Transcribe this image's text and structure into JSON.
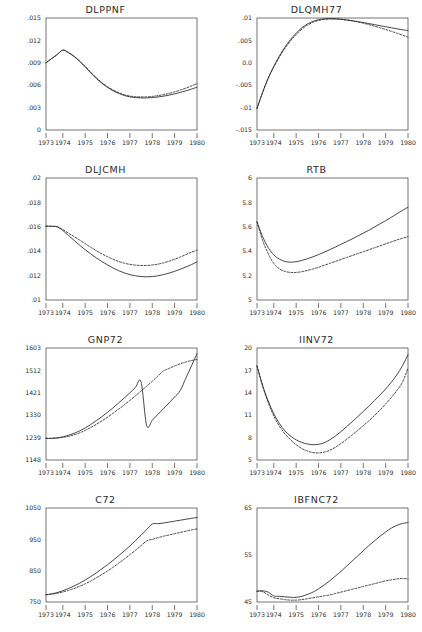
{
  "figure": {
    "layout": "2 columns x 4 rows of line charts",
    "x_categories": [
      "1973",
      "1974",
      "1975",
      "1976",
      "1977",
      "1978",
      "1979",
      "1980"
    ],
    "series_names": [
      "solid",
      "dashed"
    ]
  },
  "chart_data": [
    {
      "type": "line",
      "title": "DLPPNF",
      "xlabel": "",
      "ylabel": "",
      "xlim": [
        1973.25,
        1980.0
      ],
      "ylim": [
        0,
        0.015
      ],
      "grid": false,
      "legend": "none",
      "xticklabels": [
        "1973",
        "1974",
        "1975",
        "1976",
        "1977",
        "1978",
        "1979",
        "1980"
      ],
      "yticklabels": [
        "0",
        ".003",
        ".006",
        ".009",
        ".012",
        ".015"
      ],
      "ytickvalues": [
        0,
        0.003,
        0.006,
        0.009,
        0.012,
        0.015
      ],
      "x": [
        1973.25,
        1973.5,
        1973.75,
        1974.0,
        1974.25,
        1974.5,
        1974.75,
        1975.0,
        1975.25,
        1975.5,
        1975.75,
        1976.0,
        1976.25,
        1976.5,
        1976.75,
        1977.0,
        1977.25,
        1977.5,
        1977.75,
        1978.0,
        1978.25,
        1978.5,
        1978.75,
        1979.0,
        1979.25,
        1979.5,
        1979.75,
        1980.0
      ],
      "series": [
        {
          "name": "solid",
          "values": [
            0.009,
            0.00955,
            0.0101,
            0.0107,
            0.01035,
            0.00985,
            0.0092,
            0.00845,
            0.00765,
            0.0069,
            0.00625,
            0.0057,
            0.00525,
            0.0049,
            0.00462,
            0.00444,
            0.00434,
            0.0043,
            0.0043,
            0.00434,
            0.00442,
            0.00453,
            0.00467,
            0.00484,
            0.00503,
            0.00524,
            0.00548,
            0.00572
          ]
        },
        {
          "name": "dashed",
          "values": [
            0.009,
            0.00955,
            0.0101,
            0.0107,
            0.0104,
            0.0099,
            0.00925,
            0.00852,
            0.00775,
            0.007,
            0.00636,
            0.0058,
            0.00535,
            0.005,
            0.00472,
            0.00454,
            0.00446,
            0.00443,
            0.00444,
            0.0045,
            0.0046,
            0.00473,
            0.0049,
            0.0051,
            0.00534,
            0.0056,
            0.0059,
            0.00622
          ]
        }
      ]
    },
    {
      "type": "line",
      "title": "DLQMH77",
      "xlabel": "",
      "ylabel": "",
      "xlim": [
        1973.25,
        1980.0
      ],
      "ylim": [
        -0.015,
        0.01
      ],
      "grid": false,
      "legend": "none",
      "xticklabels": [
        "1973",
        "1974",
        "1975",
        "1976",
        "1977",
        "1978",
        "1979",
        "1980"
      ],
      "yticklabels": [
        "-.015",
        "-.01",
        "-.005",
        "0.0",
        ".005",
        ".01"
      ],
      "ytickvalues": [
        -0.015,
        -0.01,
        -0.005,
        0.0,
        0.005,
        0.01
      ],
      "x": [
        1973.25,
        1973.5,
        1973.75,
        1974.0,
        1974.25,
        1974.5,
        1974.75,
        1975.0,
        1975.25,
        1975.5,
        1975.75,
        1976.0,
        1976.25,
        1976.5,
        1976.75,
        1977.0,
        1977.25,
        1977.5,
        1977.75,
        1978.0,
        1978.25,
        1978.5,
        1978.75,
        1979.0,
        1979.25,
        1979.5,
        1979.75,
        1980.0
      ],
      "series": [
        {
          "name": "solid",
          "values": [
            -0.0102,
            -0.0066,
            -0.0034,
            -0.0008,
            0.0015,
            0.0035,
            0.0052,
            0.0066,
            0.0078,
            0.00865,
            0.00925,
            0.00962,
            0.0098,
            0.00985,
            0.00982,
            0.00972,
            0.00958,
            0.0094,
            0.0092,
            0.00898,
            0.00876,
            0.00852,
            0.00828,
            0.00805,
            0.00782,
            0.0076,
            0.00738,
            0.00718
          ]
        },
        {
          "name": "dashed",
          "values": [
            -0.0102,
            -0.00665,
            -0.0035,
            -0.00095,
            0.0013,
            0.00325,
            0.00492,
            0.0063,
            0.00748,
            0.00838,
            0.00902,
            0.00945,
            0.00968,
            0.00978,
            0.00978,
            0.0097,
            0.00955,
            0.00936,
            0.00912,
            0.00884,
            0.00852,
            0.00818,
            0.00782,
            0.00744,
            0.00704,
            0.00662,
            0.00618,
            0.00572
          ]
        }
      ]
    },
    {
      "type": "line",
      "title": "DLJCMH",
      "xlabel": "",
      "ylabel": "",
      "xlim": [
        1973.25,
        1980.0
      ],
      "ylim": [
        0.01,
        0.02
      ],
      "grid": false,
      "legend": "none",
      "xticklabels": [
        "1973",
        "1974",
        "1975",
        "1976",
        "1977",
        "1978",
        "1979",
        "1980"
      ],
      "yticklabels": [
        ".01",
        ".012",
        ".014",
        ".016",
        ".018",
        ".02"
      ],
      "ytickvalues": [
        0.01,
        0.012,
        0.014,
        0.016,
        0.018,
        0.02
      ],
      "x": [
        1973.25,
        1973.5,
        1973.75,
        1974.0,
        1974.25,
        1974.5,
        1974.75,
        1975.0,
        1975.25,
        1975.5,
        1975.75,
        1976.0,
        1976.25,
        1976.5,
        1976.75,
        1977.0,
        1977.25,
        1977.5,
        1977.75,
        1978.0,
        1978.25,
        1978.5,
        1978.75,
        1979.0,
        1979.25,
        1979.5,
        1979.75,
        1980.0
      ],
      "series": [
        {
          "name": "solid",
          "values": [
            0.01605,
            0.01604,
            0.016,
            0.0157,
            0.0153,
            0.0149,
            0.0145,
            0.01412,
            0.01378,
            0.01345,
            0.01315,
            0.01288,
            0.01262,
            0.0124,
            0.01222,
            0.01208,
            0.01198,
            0.01192,
            0.0119,
            0.01192,
            0.01198,
            0.01208,
            0.0122,
            0.01235,
            0.01252,
            0.0127,
            0.0129,
            0.01312
          ]
        },
        {
          "name": "dashed",
          "values": [
            0.01605,
            0.01604,
            0.016,
            0.01578,
            0.01548,
            0.0152,
            0.01492,
            0.01462,
            0.01432,
            0.01404,
            0.01378,
            0.01355,
            0.01334,
            0.01316,
            0.01302,
            0.01292,
            0.01286,
            0.01283,
            0.01283,
            0.01287,
            0.01294,
            0.01304,
            0.01318,
            0.01334,
            0.01352,
            0.01372,
            0.01392,
            0.01408
          ]
        }
      ]
    },
    {
      "type": "line",
      "title": "RTB",
      "xlabel": "",
      "ylabel": "",
      "xlim": [
        1973.25,
        1980.0
      ],
      "ylim": [
        5,
        6
      ],
      "grid": false,
      "legend": "none",
      "xticklabels": [
        "1973",
        "1974",
        "1975",
        "1976",
        "1977",
        "1978",
        "1979",
        "1980"
      ],
      "yticklabels": [
        "5",
        "5.2",
        "5.4",
        "5.6",
        "5.8",
        "6"
      ],
      "ytickvalues": [
        5,
        5.2,
        5.4,
        5.6,
        5.8,
        6
      ],
      "x": [
        1973.25,
        1973.5,
        1973.75,
        1974.0,
        1974.25,
        1974.5,
        1974.75,
        1975.0,
        1975.25,
        1975.5,
        1975.75,
        1976.0,
        1976.25,
        1976.5,
        1976.75,
        1977.0,
        1977.25,
        1977.5,
        1977.75,
        1978.0,
        1978.25,
        1978.5,
        1978.75,
        1979.0,
        1979.25,
        1979.5,
        1979.75,
        1980.0
      ],
      "series": [
        {
          "name": "solid",
          "values": [
            5.64,
            5.52,
            5.43,
            5.37,
            5.335,
            5.316,
            5.31,
            5.314,
            5.324,
            5.338,
            5.354,
            5.372,
            5.392,
            5.412,
            5.434,
            5.456,
            5.478,
            5.5,
            5.524,
            5.548,
            5.572,
            5.598,
            5.624,
            5.65,
            5.678,
            5.706,
            5.734,
            5.76
          ]
        },
        {
          "name": "dashed",
          "values": [
            5.64,
            5.49,
            5.38,
            5.3,
            5.256,
            5.234,
            5.226,
            5.226,
            5.232,
            5.242,
            5.254,
            5.268,
            5.284,
            5.3,
            5.316,
            5.332,
            5.348,
            5.364,
            5.38,
            5.396,
            5.412,
            5.428,
            5.444,
            5.46,
            5.476,
            5.492,
            5.506,
            5.52
          ]
        }
      ]
    },
    {
      "type": "line",
      "title": "GNP72",
      "xlabel": "",
      "ylabel": "",
      "xlim": [
        1973.25,
        1980.0
      ],
      "ylim": [
        1148,
        1603
      ],
      "grid": false,
      "legend": "none",
      "xticklabels": [
        "1973",
        "1974",
        "1975",
        "1976",
        "1977",
        "1978",
        "1979",
        "1980"
      ],
      "yticklabels": [
        "1148",
        "1239",
        "1330",
        "1421",
        "1512",
        "1603"
      ],
      "ytickvalues": [
        1148,
        1239,
        1330,
        1421,
        1512,
        1603
      ],
      "x": [
        1973.25,
        1973.5,
        1973.75,
        1974.0,
        1974.25,
        1974.5,
        1974.75,
        1975.0,
        1975.25,
        1975.5,
        1975.75,
        1976.0,
        1976.25,
        1976.5,
        1976.75,
        1977.0,
        1977.25,
        1977.5,
        1977.75,
        1978.0,
        1978.25,
        1978.5,
        1978.75,
        1979.0,
        1979.25,
        1979.5,
        1979.75,
        1980.0
      ],
      "series": [
        {
          "name": "solid",
          "values": [
            1236,
            1236,
            1238,
            1242,
            1248,
            1256,
            1266,
            1278,
            1292,
            1308,
            1324,
            1342,
            1360,
            1380,
            1400,
            1421,
            1443,
            1465,
            1288,
            1310,
            1333,
            1356,
            1380,
            1404,
            1430,
            1480,
            1530,
            1580
          ]
        },
        {
          "name": "dashed",
          "values": [
            1236,
            1236,
            1237,
            1240,
            1244,
            1250,
            1258,
            1268,
            1280,
            1293,
            1307,
            1322,
            1338,
            1355,
            1372,
            1390,
            1409,
            1428,
            1448,
            1468,
            1489,
            1510,
            1520,
            1530,
            1539,
            1546,
            1552,
            1556
          ]
        }
      ]
    },
    {
      "type": "line",
      "title": "IINV72",
      "xlabel": "",
      "ylabel": "",
      "xlim": [
        1973.25,
        1980.0
      ],
      "ylim": [
        5,
        20
      ],
      "grid": false,
      "legend": "none",
      "xticklabels": [
        "1973",
        "1974",
        "1975",
        "1976",
        "1977",
        "1978",
        "1979",
        "1980"
      ],
      "yticklabels": [
        "5",
        "8",
        "11",
        "14",
        "17",
        "20"
      ],
      "ytickvalues": [
        5,
        8,
        11,
        14,
        17,
        20
      ],
      "x": [
        1973.25,
        1973.5,
        1973.75,
        1974.0,
        1974.25,
        1974.5,
        1974.75,
        1975.0,
        1975.25,
        1975.5,
        1975.75,
        1976.0,
        1976.25,
        1976.5,
        1976.75,
        1977.0,
        1977.25,
        1977.5,
        1977.75,
        1978.0,
        1978.25,
        1978.5,
        1978.75,
        1979.0,
        1979.25,
        1979.5,
        1979.75,
        1980.0
      ],
      "series": [
        {
          "name": "solid",
          "values": [
            17.6,
            15.0,
            12.9,
            11.2,
            9.9,
            8.9,
            8.2,
            7.7,
            7.35,
            7.15,
            7.05,
            7.1,
            7.3,
            7.7,
            8.2,
            8.8,
            9.45,
            10.1,
            10.8,
            11.5,
            12.2,
            12.95,
            13.7,
            14.5,
            15.4,
            16.4,
            17.6,
            19.1
          ]
        },
        {
          "name": "dashed",
          "values": [
            17.6,
            14.9,
            12.7,
            10.9,
            9.55,
            8.5,
            7.7,
            7.05,
            6.55,
            6.2,
            6.0,
            5.95,
            6.05,
            6.3,
            6.7,
            7.2,
            7.75,
            8.35,
            8.95,
            9.6,
            10.25,
            10.95,
            11.7,
            12.5,
            13.35,
            14.3,
            15.4,
            17.3
          ]
        }
      ]
    },
    {
      "type": "line",
      "title": "C72",
      "xlabel": "",
      "ylabel": "",
      "xlim": [
        1973.25,
        1980.0
      ],
      "ylim": [
        750,
        1050
      ],
      "grid": false,
      "legend": "none",
      "xticklabels": [
        "1973",
        "1974",
        "1975",
        "1976",
        "1977",
        "1978",
        "1979",
        "1980"
      ],
      "yticklabels": [
        "750",
        "850",
        "950",
        "1050"
      ],
      "ytickvalues": [
        750,
        850,
        950,
        1050
      ],
      "x": [
        1973.25,
        1973.5,
        1973.75,
        1974.0,
        1974.25,
        1974.5,
        1974.75,
        1975.0,
        1975.25,
        1975.5,
        1975.75,
        1976.0,
        1976.25,
        1976.5,
        1976.75,
        1977.0,
        1977.25,
        1977.5,
        1977.75,
        1978.0,
        1978.25,
        1978.5,
        1978.75,
        1979.0,
        1979.25,
        1979.5,
        1979.75,
        1980.0
      ],
      "series": [
        {
          "name": "solid",
          "values": [
            773,
            776,
            780,
            786,
            793,
            801,
            810,
            820,
            831,
            843,
            856,
            869,
            883,
            898,
            913,
            929,
            946,
            963,
            981,
            999,
            1000,
            1002,
            1005,
            1008,
            1011,
            1014,
            1017,
            1020
          ]
        },
        {
          "name": "dashed",
          "values": [
            773,
            775,
            778,
            782,
            787,
            793,
            800,
            808,
            817,
            827,
            838,
            849,
            861,
            874,
            887,
            901,
            915,
            930,
            945,
            950,
            955,
            960,
            964,
            968,
            972,
            976,
            980,
            983
          ]
        }
      ]
    },
    {
      "type": "line",
      "title": "IBFNC72",
      "xlabel": "",
      "ylabel": "",
      "xlim": [
        1973.25,
        1980.0
      ],
      "ylim": [
        45,
        65
      ],
      "grid": false,
      "legend": "none",
      "xticklabels": [
        "1973",
        "1974",
        "1975",
        "1976",
        "1977",
        "1978",
        "1979",
        "1980"
      ],
      "yticklabels": [
        "45",
        "55",
        "65"
      ],
      "ytickvalues": [
        45,
        55,
        65
      ],
      "x": [
        1973.25,
        1973.5,
        1973.75,
        1974.0,
        1974.25,
        1974.5,
        1974.75,
        1975.0,
        1975.25,
        1975.5,
        1975.75,
        1976.0,
        1976.25,
        1976.5,
        1976.75,
        1977.0,
        1977.25,
        1977.5,
        1977.75,
        1978.0,
        1978.25,
        1978.5,
        1978.75,
        1979.0,
        1979.25,
        1979.5,
        1979.75,
        1980.0
      ],
      "series": [
        {
          "name": "solid",
          "values": [
            47.3,
            47.4,
            47.1,
            46.3,
            46.2,
            46.1,
            46.0,
            46.0,
            46.2,
            46.6,
            47.1,
            47.8,
            48.6,
            49.5,
            50.5,
            51.5,
            52.6,
            53.7,
            54.8,
            55.9,
            57.0,
            58.0,
            59.0,
            59.9,
            60.7,
            61.3,
            61.7,
            61.9
          ]
        },
        {
          "name": "dashed",
          "values": [
            47.3,
            47.2,
            46.5,
            45.9,
            45.7,
            45.5,
            45.4,
            45.4,
            45.5,
            45.7,
            45.9,
            46.1,
            46.3,
            46.5,
            46.8,
            47.1,
            47.4,
            47.7,
            48.0,
            48.3,
            48.6,
            48.9,
            49.2,
            49.5,
            49.7,
            49.9,
            50.0,
            49.9
          ]
        }
      ]
    }
  ]
}
